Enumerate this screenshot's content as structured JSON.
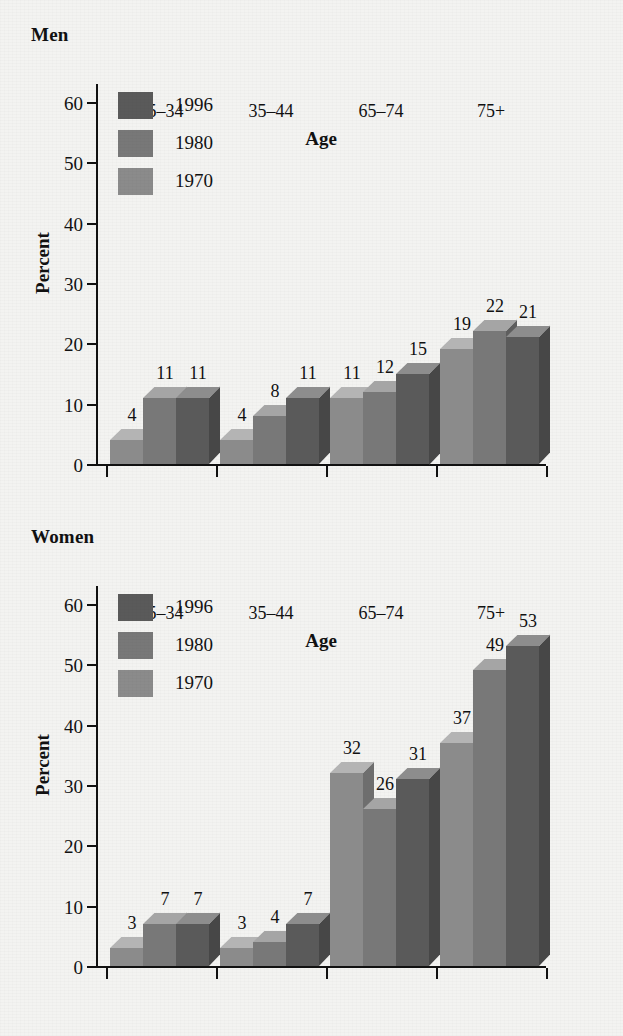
{
  "colors": {
    "background": "#f3f3f1",
    "axis": "#111111",
    "series_1970_front": "#8b8b8b",
    "series_1970_top": "#b4b4b4",
    "series_1970_side": "#6e6e6e",
    "series_1980_front": "#787878",
    "series_1980_top": "#a5a5a5",
    "series_1980_side": "#5e5e5e",
    "series_1996_front": "#5a5a5a",
    "series_1996_top": "#8d8d8d",
    "series_1996_side": "#474747"
  },
  "charts": [
    {
      "id": "men",
      "title": "Men",
      "legend": [
        {
          "label": "1996",
          "key": "1996"
        },
        {
          "label": "1980",
          "key": "1980"
        },
        {
          "label": "1970",
          "key": "1970"
        }
      ],
      "chart_data": {
        "type": "bar",
        "title": "Men",
        "xlabel": "Age",
        "ylabel": "Percent",
        "categories": [
          "25–34",
          "35–44",
          "65–74",
          "75+"
        ],
        "yticks": [
          0,
          10,
          20,
          30,
          40,
          50,
          60
        ],
        "ylim": [
          0,
          60
        ],
        "grid": false,
        "legend_position": "top-left",
        "series": [
          {
            "name": "1970",
            "values": [
              4,
              4,
              11,
              19
            ]
          },
          {
            "name": "1980",
            "values": [
              11,
              8,
              12,
              22
            ]
          },
          {
            "name": "1996",
            "values": [
              11,
              11,
              15,
              21
            ]
          }
        ]
      }
    },
    {
      "id": "women",
      "title": "Women",
      "legend": [
        {
          "label": "1996",
          "key": "1996"
        },
        {
          "label": "1980",
          "key": "1980"
        },
        {
          "label": "1970",
          "key": "1970"
        }
      ],
      "chart_data": {
        "type": "bar",
        "title": "Women",
        "xlabel": "Age",
        "ylabel": "Percent",
        "categories": [
          "25–34",
          "35–44",
          "65–74",
          "75+"
        ],
        "yticks": [
          0,
          10,
          20,
          30,
          40,
          50,
          60
        ],
        "ylim": [
          0,
          60
        ],
        "grid": false,
        "legend_position": "top-left",
        "series": [
          {
            "name": "1970",
            "values": [
              3,
              3,
              32,
              37
            ]
          },
          {
            "name": "1980",
            "values": [
              7,
              4,
              26,
              49
            ]
          },
          {
            "name": "1996",
            "values": [
              7,
              7,
              31,
              53
            ]
          }
        ]
      }
    }
  ]
}
